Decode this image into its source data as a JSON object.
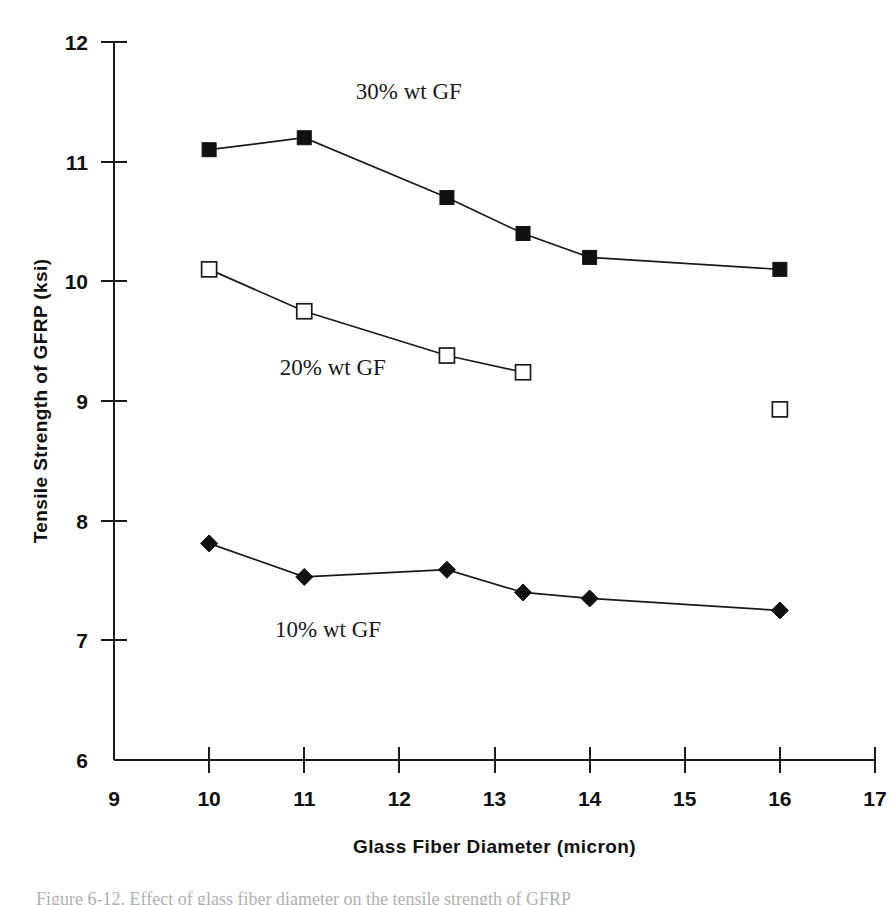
{
  "figure": {
    "caption_partial": "Figure 6-12.  Effect of glass fiber diameter on the tensile strength of GFRP"
  },
  "chart_data": {
    "type": "line",
    "title": "",
    "xlabel": "Glass Fiber Diameter (micron)",
    "ylabel": "Tensile Strength of GFRP (ksi)",
    "xlim": [
      9,
      17
    ],
    "ylim": [
      6,
      12
    ],
    "xticks": [
      9,
      10,
      11,
      12,
      13,
      14,
      15,
      16,
      17
    ],
    "yticks": [
      6,
      7,
      8,
      9,
      10,
      11,
      12
    ],
    "xtick_labels": [
      "9",
      "10",
      "11",
      "12",
      "13",
      "14",
      "15",
      "16",
      "17"
    ],
    "ytick_labels": [
      "6",
      "7",
      "8",
      "9",
      "10",
      "11",
      "12"
    ],
    "grid": false,
    "legend_position": "inline-annotations",
    "series": [
      {
        "name": "30% wt GF",
        "marker": "filled-square",
        "annotation": "30% wt GF",
        "annotation_x": 12.1,
        "annotation_y": 11.52,
        "x": [
          10,
          11,
          12.5,
          13.3,
          14,
          16
        ],
        "values": [
          11.1,
          11.2,
          10.7,
          10.4,
          10.2,
          10.1
        ]
      },
      {
        "name": "20% wt GF",
        "marker": "open-square",
        "annotation": "20% wt GF",
        "annotation_x": 11.3,
        "annotation_y": 9.22,
        "x": [
          10,
          11,
          12.5,
          13.3
        ],
        "values": [
          10.1,
          9.75,
          9.38,
          9.24
        ]
      },
      {
        "name": "10% wt GF",
        "marker": "filled-diamond",
        "annotation": "10% wt GF",
        "annotation_x": 11.25,
        "annotation_y": 7.03,
        "x": [
          10,
          11,
          12.5,
          13.3,
          14,
          16
        ],
        "values": [
          7.81,
          7.53,
          7.59,
          7.4,
          7.35,
          7.25
        ]
      }
    ],
    "isolated_points": [
      {
        "series": "20% wt GF",
        "marker": "open-square",
        "x": 16,
        "y": 8.93
      }
    ]
  },
  "colors": {
    "ink": "#111111",
    "axis": "#1a1a1a",
    "background": "#ffffff"
  }
}
